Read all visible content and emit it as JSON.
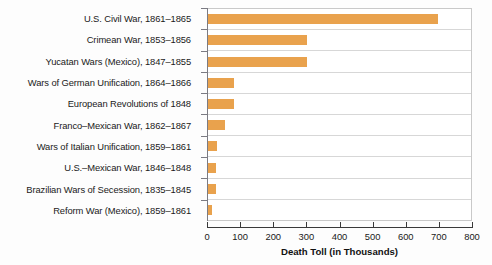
{
  "chart_data": {
    "type": "bar",
    "orientation": "horizontal",
    "title": "",
    "xlabel": "Death Toll (in Thousands)",
    "ylabel": "",
    "xlim": [
      0,
      800
    ],
    "xticks": [
      0,
      100,
      200,
      300,
      400,
      500,
      600,
      700,
      800
    ],
    "grid": "horizontal-row-separators",
    "legend": "none",
    "bar_color": "#e9a24d",
    "categories": [
      "U.S. Civil War, 1861–1865",
      "Crimean War, 1853–1856",
      "Yucatan Wars (Mexico), 1847–1855",
      "Wars of German Unification, 1864–1866",
      "European Revolutions of 1848",
      "Franco–Mexican War, 1862–1867",
      "Wars of Italian Unification, 1859–1861",
      "U.S.–Mexican War, 1846–1848",
      "Brazilian Wars of Secession, 1835–1845",
      "Reform War (Mexico), 1859–1861"
    ],
    "values": [
      700,
      300,
      300,
      80,
      80,
      52,
      27,
      24,
      24,
      13
    ]
  }
}
